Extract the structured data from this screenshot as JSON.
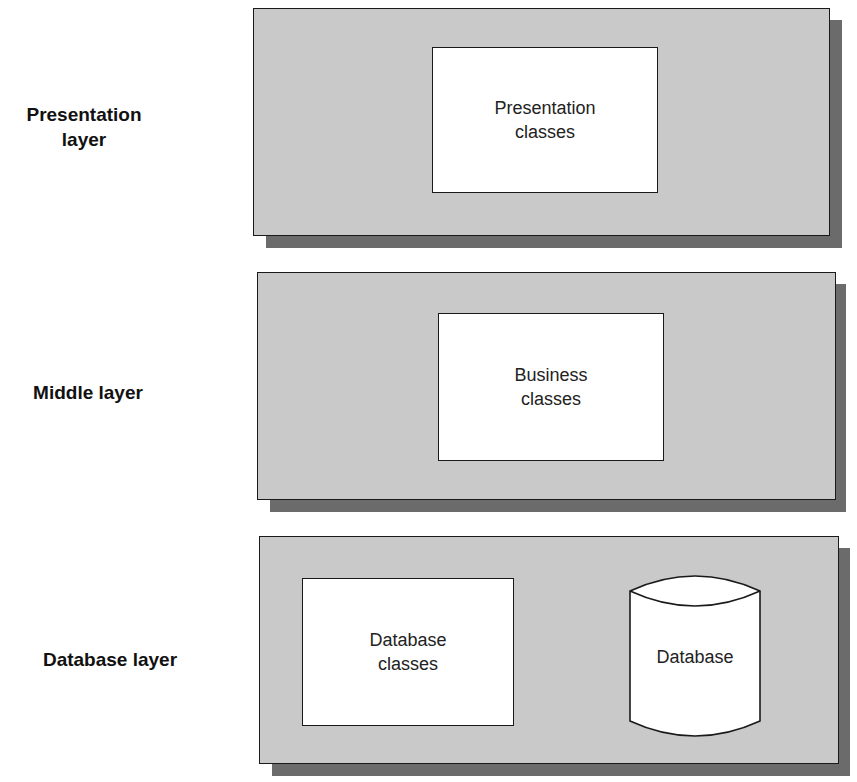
{
  "layers": [
    {
      "label_line1": "Presentation",
      "label_line2": "layer",
      "components": [
        {
          "type": "box",
          "line1": "Presentation",
          "line2": "classes"
        }
      ]
    },
    {
      "label_line1": "Middle layer",
      "label_line2": "",
      "components": [
        {
          "type": "box",
          "line1": "Business",
          "line2": "classes"
        }
      ]
    },
    {
      "label_line1": "Database layer",
      "label_line2": "",
      "components": [
        {
          "type": "box",
          "line1": "Database",
          "line2": "classes"
        },
        {
          "type": "cylinder",
          "line1": "Database"
        }
      ]
    }
  ],
  "colors": {
    "panel": "#c9c9c9",
    "shadow": "#6b6b6b",
    "box": "#ffffff",
    "stroke": "#1a1a1a"
  }
}
